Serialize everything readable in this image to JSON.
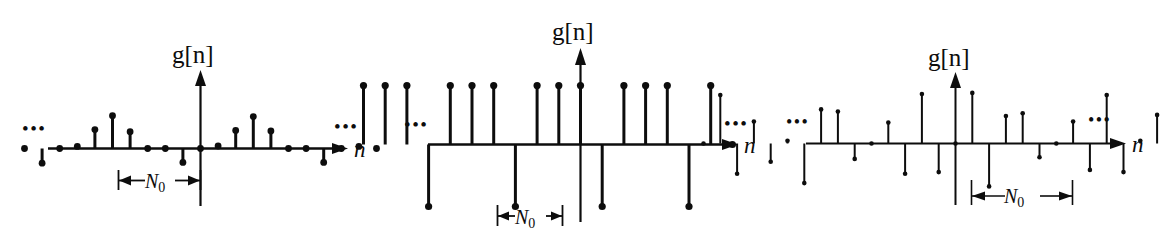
{
  "figure": {
    "title": "",
    "background": "#ffffff",
    "ink": "#0d0d0d"
  },
  "panels": [
    {
      "id": "panel-1",
      "y_axis_label": "g[n]",
      "x_axis_label": "n",
      "period_label": "N",
      "period_subscript": "0",
      "left_ellipsis": "•••",
      "right_ellipsis": "•••"
    },
    {
      "id": "panel-2",
      "y_axis_label": "g[n]",
      "x_axis_label": "n",
      "period_label": "N",
      "period_subscript": "0",
      "left_ellipsis": "•••",
      "right_ellipsis": "•••"
    },
    {
      "id": "panel-3",
      "y_axis_label": "g[n]",
      "x_axis_label": "n",
      "period_label": "N",
      "period_subscript": "0",
      "left_ellipsis": "•••",
      "right_ellipsis": "•••"
    }
  ],
  "chart_data": [
    {
      "type": "line",
      "plot_style": "stem",
      "title": "g[n]",
      "xlabel": "n",
      "ylabel": "g[n]",
      "periodic": true,
      "period": 8,
      "period_annotation": "N0",
      "period_annotation_from_n": -8,
      "period_annotation_to_n": 0,
      "grid": false,
      "legend": false,
      "ylim": [
        -0.45,
        1.0
      ],
      "x": [
        -14,
        -13,
        -12,
        -11,
        -10,
        -9,
        -8,
        -7,
        -6,
        -5,
        -4,
        -3,
        -2,
        -1,
        0,
        1,
        2,
        3,
        4,
        5,
        6,
        7,
        8,
        9,
        10
      ],
      "values": [
        0.0,
        0.75,
        0.45,
        0.05,
        0.0,
        -0.35,
        0.0,
        0.05,
        0.45,
        0.78,
        0.4,
        0.0,
        0.0,
        -0.33,
        0.0,
        0.06,
        0.43,
        0.76,
        0.42,
        0.0,
        0.0,
        -0.33,
        0.0,
        0.05,
        0.0
      ],
      "series": [
        {
          "name": "g[n]",
          "values": [
            0.0,
            0.75,
            0.45,
            0.05,
            0.0,
            -0.35,
            0.0,
            0.05,
            0.45,
            0.78,
            0.4,
            0.0,
            0.0,
            -0.33,
            0.0,
            0.06,
            0.43,
            0.76,
            0.42,
            0.0,
            0.0,
            -0.33,
            0.0,
            0.05,
            0.0
          ]
        }
      ]
    },
    {
      "type": "line",
      "plot_style": "stem",
      "title": "g[n]",
      "xlabel": "n",
      "ylabel": "g[n]",
      "periodic": true,
      "period": 4,
      "period_annotation": "N0",
      "period_annotation_from_n": -8,
      "period_annotation_to_n": -4,
      "grid": false,
      "legend": false,
      "ylim": [
        -1.05,
        1.05
      ],
      "x": [
        -10,
        -9,
        -8,
        -7,
        -6,
        -5,
        -4,
        -3,
        -2,
        -1,
        0,
        1,
        2,
        3,
        4,
        5,
        6,
        7
      ],
      "values": [
        0.95,
        0.95,
        0.95,
        -1.0,
        0.95,
        0.95,
        0.95,
        -1.0,
        0.95,
        0.95,
        0.95,
        -1.0,
        0.95,
        0.95,
        0.95,
        -1.0,
        0.95,
        0.0
      ],
      "series": [
        {
          "name": "g[n]",
          "values": [
            0.95,
            0.95,
            0.95,
            -1.0,
            0.95,
            0.95,
            0.95,
            -1.0,
            0.95,
            0.95,
            0.95,
            -1.0,
            0.95,
            0.95,
            0.95,
            -1.0,
            0.95,
            0.0
          ]
        }
      ]
    },
    {
      "type": "line",
      "plot_style": "stem",
      "title": "g[n]",
      "xlabel": "n",
      "ylabel": "g[n]",
      "periodic": true,
      "period": 8,
      "period_annotation": "N0",
      "period_annotation_from_n": 1,
      "period_annotation_to_n": 9,
      "grid": false,
      "legend": false,
      "ylim": [
        -0.8,
        0.95
      ],
      "x": [
        -15,
        -14,
        -13,
        -12,
        -11,
        -10,
        -9,
        -8,
        -7,
        -6,
        -5,
        -4,
        -3,
        -2,
        -1,
        0,
        1,
        2,
        3,
        4,
        5,
        6,
        7,
        8,
        9,
        10,
        11,
        12,
        13
      ],
      "values": [
        0.0,
        0.88,
        -0.55,
        0.4,
        -0.33,
        0.05,
        -0.72,
        0.62,
        0.58,
        -0.28,
        0.0,
        0.38,
        -0.55,
        0.9,
        -0.52,
        0.0,
        0.92,
        -0.78,
        0.5,
        0.55,
        -0.25,
        0.0,
        0.4,
        -0.48,
        0.88,
        -0.52,
        0.05,
        0.52,
        -0.3
      ],
      "series": [
        {
          "name": "g[n]",
          "values": [
            0.0,
            0.88,
            -0.55,
            0.4,
            -0.33,
            0.05,
            -0.72,
            0.62,
            0.58,
            -0.28,
            0.0,
            0.38,
            -0.55,
            0.9,
            -0.52,
            0.0,
            0.92,
            -0.78,
            0.5,
            0.55,
            -0.25,
            0.0,
            0.4,
            -0.48,
            0.88,
            -0.52,
            0.05,
            0.52,
            -0.3
          ]
        }
      ]
    }
  ]
}
